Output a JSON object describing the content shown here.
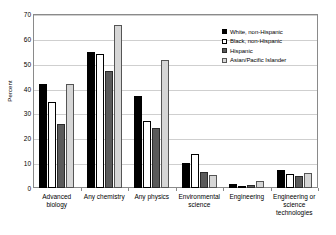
{
  "chart_data": {
    "type": "bar",
    "title": "",
    "subtitle": "",
    "xlabel": "",
    "ylabel": "Percent",
    "ylim": [
      0,
      70
    ],
    "ytick_step": 10,
    "yticks": [
      0,
      10,
      20,
      30,
      40,
      50,
      60,
      70
    ],
    "grid": true,
    "legend_position": "top-right",
    "categories": [
      "Advanced biology",
      "Any chemistry",
      "Any physics",
      "Environmental science",
      "Engineering",
      "Engineering or science technologies"
    ],
    "series": [
      {
        "name": "White, non-Hispanic",
        "color": "#000000",
        "values": [
          42.0,
          54.8,
          37.0,
          10.0,
          1.5,
          7.2
        ]
      },
      {
        "name": "Black, non-Hispanic",
        "color": "#ffffff",
        "values": [
          34.5,
          53.8,
          26.8,
          13.6,
          0.8,
          5.8
        ]
      },
      {
        "name": "Hispanic",
        "color": "#5a5a5a",
        "values": [
          25.8,
          47.0,
          24.2,
          6.6,
          1.2,
          5.0
        ]
      },
      {
        "name": "Asian/Pacific Islander",
        "color": "#d6d6d6",
        "values": [
          42.0,
          65.5,
          51.5,
          5.4,
          2.9,
          6.1
        ]
      }
    ]
  },
  "axis": {
    "y_title": "Percent"
  },
  "category_lines": [
    [
      "Advanced",
      "biology"
    ],
    [
      "Any chemistry"
    ],
    [
      "Any physics"
    ],
    [
      "Environmental",
      "science"
    ],
    [
      "Engineering"
    ],
    [
      "Engineering or",
      "science",
      "technologies"
    ]
  ]
}
